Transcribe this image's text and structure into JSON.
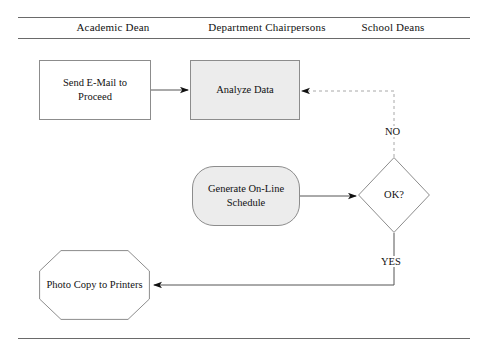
{
  "diagram": {
    "type": "swimlane-flowchart",
    "lanes": [
      {
        "id": "academic-dean",
        "label": "Academic Dean"
      },
      {
        "id": "department-chairpersons",
        "label": "Department Chairpersons"
      },
      {
        "id": "school-deans",
        "label": "School Deans"
      }
    ],
    "nodes": [
      {
        "id": "send-email",
        "label": "Send E-Mail to Proceed",
        "shape": "rectangle",
        "lane": "academic-dean",
        "fill": "#ffffff",
        "stroke": "#8c8c8c"
      },
      {
        "id": "analyze-data",
        "label": "Analyze Data",
        "shape": "rectangle",
        "lane": "department-chairpersons",
        "fill": "#ececec",
        "stroke": "#8c8c8c"
      },
      {
        "id": "generate-schedule",
        "label": "Generate On-Line Schedule",
        "shape": "rounded-rectangle",
        "lane": "department-chairpersons",
        "fill": "#ececec",
        "stroke": "#8c8c8c"
      },
      {
        "id": "decision-ok",
        "label": "OK?",
        "shape": "diamond",
        "lane": "school-deans",
        "fill": "#ffffff",
        "stroke": "#8c8c8c"
      },
      {
        "id": "photo-copy",
        "label": "Photo Copy to Printers",
        "shape": "octagon",
        "lane": "academic-dean",
        "fill": "#ffffff",
        "stroke": "#8c8c8c"
      }
    ],
    "edges": [
      {
        "id": "email-to-analyze",
        "from": "send-email",
        "to": "analyze-data",
        "label": "",
        "style": "solid"
      },
      {
        "id": "schedule-to-decision",
        "from": "generate-schedule",
        "to": "decision-ok",
        "label": "",
        "style": "solid"
      },
      {
        "id": "decision-no-to-analyze",
        "from": "decision-ok",
        "to": "analyze-data",
        "label": "NO",
        "style": "dashed"
      },
      {
        "id": "decision-yes-to-photocopy",
        "from": "decision-ok",
        "to": "photo-copy",
        "label": "YES",
        "style": "solid"
      }
    ],
    "colors": {
      "shaded_fill": "#ececec",
      "plain_fill": "#ffffff",
      "shape_stroke": "#8c8c8c",
      "solid_edge": "#555555",
      "dashed_edge": "#a8a8a8",
      "rule": "#6a6a6a",
      "text": "#111111"
    }
  }
}
